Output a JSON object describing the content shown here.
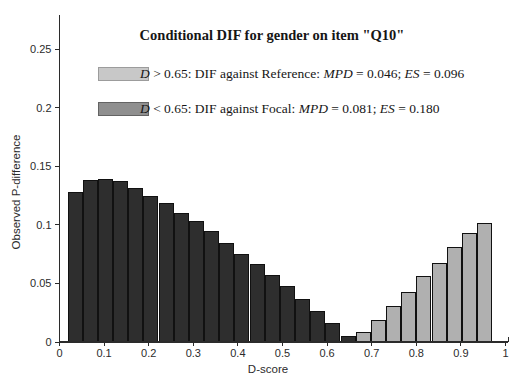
{
  "chart_data": {
    "type": "bar",
    "title": "Conditional DIF for gender on item \"Q10\"",
    "xlabel": "D-score",
    "ylabel": "Observed P-difference",
    "xlim": [
      0,
      1
    ],
    "ylim": [
      0,
      0.28
    ],
    "grid": false,
    "legend_position": "upper left inside plot",
    "x_ticks": [
      "0",
      "0.1",
      "0.2",
      "0.3",
      "0.4",
      "0.5",
      "0.6",
      "0.7",
      "0.8",
      "0.9",
      "1"
    ],
    "y_ticks": [
      "0",
      "0.05",
      "0.1",
      "0.15",
      "0.2",
      "0.25"
    ],
    "bin_width": 0.034,
    "groups": {
      "focal": {
        "label": "D < 0.65: DIF against Focal",
        "bar_color": "#2e2e2e"
      },
      "reference": {
        "label": "D > 0.65: DIF against Reference",
        "bar_color": "#b0b0b0"
      }
    },
    "bars": [
      {
        "x": 0.035,
        "y": 0.128,
        "group": "focal"
      },
      {
        "x": 0.069,
        "y": 0.138,
        "group": "focal"
      },
      {
        "x": 0.103,
        "y": 0.139,
        "group": "focal"
      },
      {
        "x": 0.137,
        "y": 0.137,
        "group": "focal"
      },
      {
        "x": 0.171,
        "y": 0.131,
        "group": "focal"
      },
      {
        "x": 0.205,
        "y": 0.124,
        "group": "focal"
      },
      {
        "x": 0.239,
        "y": 0.118,
        "group": "focal"
      },
      {
        "x": 0.273,
        "y": 0.11,
        "group": "focal"
      },
      {
        "x": 0.307,
        "y": 0.103,
        "group": "focal"
      },
      {
        "x": 0.341,
        "y": 0.094,
        "group": "focal"
      },
      {
        "x": 0.375,
        "y": 0.084,
        "group": "focal"
      },
      {
        "x": 0.409,
        "y": 0.075,
        "group": "focal"
      },
      {
        "x": 0.443,
        "y": 0.066,
        "group": "focal"
      },
      {
        "x": 0.477,
        "y": 0.057,
        "group": "focal"
      },
      {
        "x": 0.511,
        "y": 0.047,
        "group": "focal"
      },
      {
        "x": 0.545,
        "y": 0.036,
        "group": "focal"
      },
      {
        "x": 0.579,
        "y": 0.026,
        "group": "focal"
      },
      {
        "x": 0.613,
        "y": 0.016,
        "group": "focal"
      },
      {
        "x": 0.647,
        "y": 0.005,
        "group": "focal"
      },
      {
        "x": 0.681,
        "y": 0.008,
        "group": "reference"
      },
      {
        "x": 0.715,
        "y": 0.018,
        "group": "reference"
      },
      {
        "x": 0.749,
        "y": 0.03,
        "group": "reference"
      },
      {
        "x": 0.783,
        "y": 0.042,
        "group": "reference"
      },
      {
        "x": 0.817,
        "y": 0.056,
        "group": "reference"
      },
      {
        "x": 0.851,
        "y": 0.067,
        "group": "reference"
      },
      {
        "x": 0.885,
        "y": 0.081,
        "group": "reference"
      },
      {
        "x": 0.919,
        "y": 0.093,
        "group": "reference"
      },
      {
        "x": 0.953,
        "y": 0.101,
        "group": "reference"
      }
    ]
  },
  "legend": {
    "rows": [
      {
        "swatch_color": "#c8c8c8",
        "swatch_border": "#9c9c9c",
        "text": "D > 0.65: DIF against Reference: MPD = 0.046; ES = 0.096",
        "segments": [
          {
            "t": "D",
            "i": true
          },
          {
            "t": " > 0.65: DIF against Reference: ",
            "i": false
          },
          {
            "t": "MPD",
            "i": true
          },
          {
            "t": " = 0.046; ",
            "i": false
          },
          {
            "t": "ES",
            "i": true
          },
          {
            "t": " = 0.096",
            "i": false
          }
        ]
      },
      {
        "swatch_color": "#8f8f8f",
        "swatch_border": "#636363",
        "text": "D < 0.65: DIF against Focal: MPD = 0.081; ES = 0.180",
        "segments": [
          {
            "t": "D",
            "i": true
          },
          {
            "t": " < 0.65: DIF against Focal: ",
            "i": false
          },
          {
            "t": "MPD",
            "i": true
          },
          {
            "t": " = 0.081; ",
            "i": false
          },
          {
            "t": "ES",
            "i": true
          },
          {
            "t": " = 0.180",
            "i": false
          }
        ]
      }
    ]
  },
  "colors": {
    "background": "#ffffff",
    "axis": "#2b2b2b",
    "bar_edge": "#111111"
  }
}
